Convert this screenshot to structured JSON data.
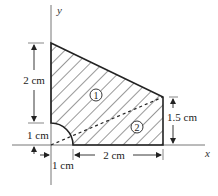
{
  "figure": {
    "type": "composite-area-diagram",
    "axes": {
      "x_label": "x",
      "y_label": "y"
    },
    "regions": [
      {
        "id": "region-1",
        "label": "1",
        "shape": "triangle (upper, above dashed diagonal)"
      },
      {
        "id": "region-2",
        "label": "2",
        "shape": "triangle (lower, below dashed diagonal)"
      }
    ],
    "cutout": {
      "shape": "quarter-circle",
      "radius": "1 cm",
      "position": "origin"
    },
    "dimensions": {
      "left_height": "2 cm",
      "cutout_radius_vertical": "1 cm",
      "cutout_radius_horizontal": "1 cm",
      "bottom_width": "2 cm",
      "right_height": "1.5 cm"
    },
    "colors": {
      "stroke": "#222222",
      "hatch": "#333333",
      "axis": "#666666",
      "background": "#ffffff"
    }
  }
}
